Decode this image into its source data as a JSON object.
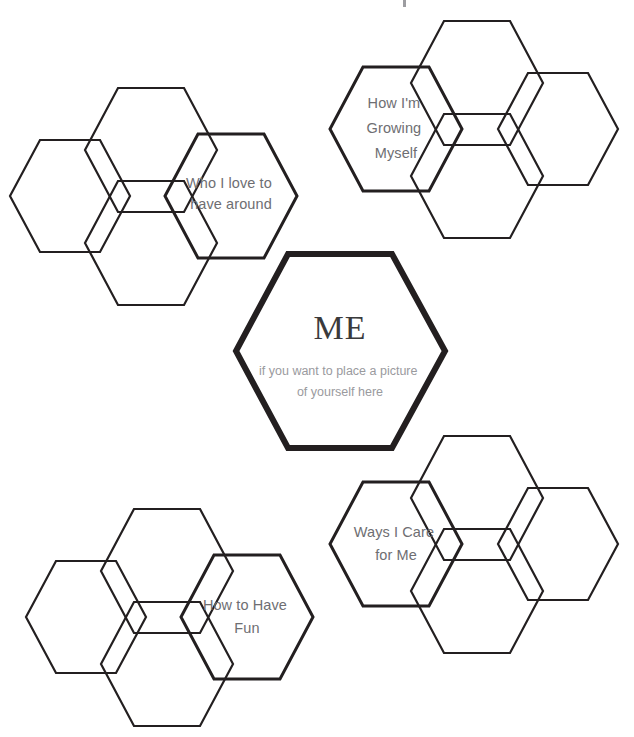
{
  "page": {
    "background_color": "#ffffff",
    "stroke_color": "#231f20",
    "label_color": "#6e6e72",
    "subtext_color": "#9a9a9e",
    "width": 634,
    "height": 737
  },
  "center": {
    "name": "me-hexagon",
    "title": "ME",
    "subtitle_line1": "if you want to place a picture",
    "subtitle_line2": "of  yourself here",
    "cx": 340,
    "cy": 351,
    "rx": 105,
    "ry": 97
  },
  "clusters": [
    {
      "id": "who-i-love-to-have-around",
      "label_line1": "Who I love to",
      "label_line2": "have around",
      "label_x": 231,
      "label_y": 188,
      "main": {
        "cx": 231,
        "cy": 196,
        "rx": 66,
        "ry": 62
      },
      "satellites": [
        {
          "name": "satellite-top",
          "cx": 151,
          "cy": 150,
          "rx": 66,
          "ry": 62
        },
        {
          "name": "satellite-left",
          "cx": 70,
          "cy": 196,
          "rx": 60,
          "ry": 56
        },
        {
          "name": "satellite-bottom",
          "cx": 151,
          "cy": 243,
          "rx": 66,
          "ry": 62
        }
      ]
    },
    {
      "id": "how-im-growing-myself",
      "label_line1": "How I'm",
      "label_line2": "Growing",
      "label_line3": "Myself",
      "label_x": 396,
      "label_y": 104,
      "main": {
        "cx": 396,
        "cy": 129,
        "rx": 66,
        "ry": 62
      },
      "satellites": [
        {
          "name": "satellite-top",
          "cx": 477,
          "cy": 83,
          "rx": 66,
          "ry": 62
        },
        {
          "name": "satellite-right",
          "cx": 558,
          "cy": 129,
          "rx": 60,
          "ry": 56
        },
        {
          "name": "satellite-bottom",
          "cx": 477,
          "cy": 176,
          "rx": 66,
          "ry": 62
        }
      ]
    },
    {
      "id": "how-to-have-fun",
      "label_line1": "How to Have",
      "label_line2": "Fun",
      "label_x": 247,
      "label_y": 610,
      "main": {
        "cx": 247,
        "cy": 617,
        "rx": 66,
        "ry": 62
      },
      "satellites": [
        {
          "name": "satellite-top",
          "cx": 167,
          "cy": 571,
          "rx": 66,
          "ry": 62
        },
        {
          "name": "satellite-left",
          "cx": 86,
          "cy": 617,
          "rx": 60,
          "ry": 56
        },
        {
          "name": "satellite-bottom",
          "cx": 167,
          "cy": 664,
          "rx": 66,
          "ry": 62
        }
      ]
    },
    {
      "id": "ways-i-care-for-me",
      "label_line1": "Ways I Care",
      "label_line2": "for Me",
      "label_x": 396,
      "label_y": 536,
      "main": {
        "cx": 396,
        "cy": 544,
        "rx": 66,
        "ry": 62
      },
      "satellites": [
        {
          "name": "satellite-top",
          "cx": 477,
          "cy": 498,
          "rx": 66,
          "ry": 62
        },
        {
          "name": "satellite-right",
          "cx": 558,
          "cy": 544,
          "rx": 60,
          "ry": 56
        },
        {
          "name": "satellite-bottom",
          "cx": 477,
          "cy": 591,
          "rx": 66,
          "ry": 62
        }
      ]
    }
  ]
}
